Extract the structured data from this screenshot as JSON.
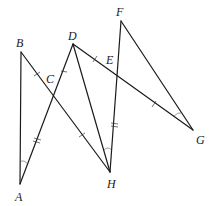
{
  "diagram": {
    "type": "geometry",
    "points": {
      "A": {
        "label": "A",
        "x": 20,
        "y": 184
      },
      "B": {
        "label": "B",
        "x": 21,
        "y": 52
      },
      "C": {
        "label": "C",
        "x": 54,
        "y": 98
      },
      "D": {
        "label": "D",
        "x": 73,
        "y": 44
      },
      "E": {
        "label": "E",
        "x": 118,
        "y": 77
      },
      "F": {
        "label": "F",
        "x": 121,
        "y": 21
      },
      "G": {
        "label": "G",
        "x": 193,
        "y": 130
      },
      "H": {
        "label": "H",
        "x": 110,
        "y": 172
      }
    },
    "segments": [
      "AB",
      "BH",
      "AD",
      "DH",
      "DG",
      "FH",
      "FG"
    ],
    "tick_marks": {
      "single": [
        "BC",
        "DE",
        "CH",
        "EG"
      ],
      "double": [
        "AC",
        "EH"
      ]
    },
    "angle_marks": [
      "BAD (at A)",
      "DHF (at H)",
      "FGD (at G)"
    ]
  }
}
